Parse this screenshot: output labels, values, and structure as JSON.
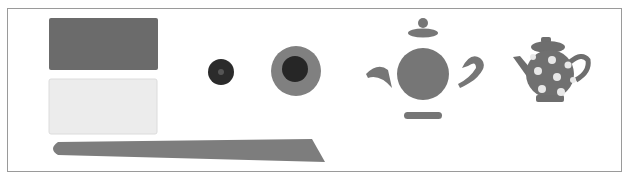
{
  "scene": {
    "description": "Grayscale illustration of modeling clay pieces forming a polka-dot teapot",
    "colors": {
      "frame": "#9a9a9a",
      "dark_clay": "#6a6a6a",
      "light_clay": "#ececec",
      "mid_clay": "#767676",
      "black_clay": "#2a2a2a",
      "dots": "#e8e8e8"
    },
    "items": [
      {
        "name": "dark-clay-block"
      },
      {
        "name": "light-clay-block"
      },
      {
        "name": "clay-modeling-tool"
      },
      {
        "name": "small-black-clay-ball"
      },
      {
        "name": "flattened-clay-disc"
      },
      {
        "name": "teapot-parts"
      },
      {
        "name": "finished-polka-dot-teapot"
      }
    ]
  }
}
